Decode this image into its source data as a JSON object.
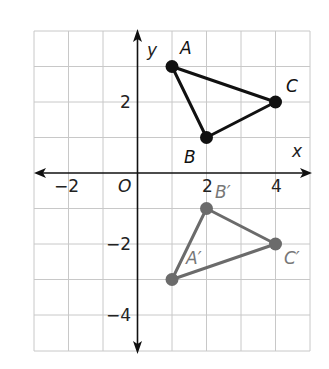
{
  "diagram": {
    "type": "coordinate-plane-reflection",
    "axes": {
      "x_label": "x",
      "y_label": "y",
      "origin_label": "O",
      "x_ticks": [
        {
          "value": -2,
          "label": "−2"
        },
        {
          "value": 2,
          "label": "2"
        },
        {
          "value": 4,
          "label": "4"
        }
      ],
      "y_ticks": [
        {
          "value": 2,
          "label": "2"
        },
        {
          "value": -2,
          "label": "−2"
        },
        {
          "value": -4,
          "label": "−4"
        }
      ],
      "x_range": [
        -3,
        5
      ],
      "y_range": [
        -5,
        4
      ],
      "grid": true
    },
    "figures": [
      {
        "name": "triangle ABC",
        "color": "#111111",
        "points": [
          {
            "label": "A",
            "x": 1,
            "y": 3
          },
          {
            "label": "B",
            "x": 2,
            "y": 1
          },
          {
            "label": "C",
            "x": 4,
            "y": 2
          }
        ]
      },
      {
        "name": "triangle A'B'C'",
        "color": "#6b6b6b",
        "points": [
          {
            "label": "A′",
            "x": 1,
            "y": -3
          },
          {
            "label": "B′",
            "x": 2,
            "y": -1
          },
          {
            "label": "C′",
            "x": 4,
            "y": -2
          }
        ]
      }
    ],
    "colors": {
      "grid": "#c8c8c8",
      "axis": "#111111",
      "image_triangle": "#6b6b6b"
    }
  }
}
